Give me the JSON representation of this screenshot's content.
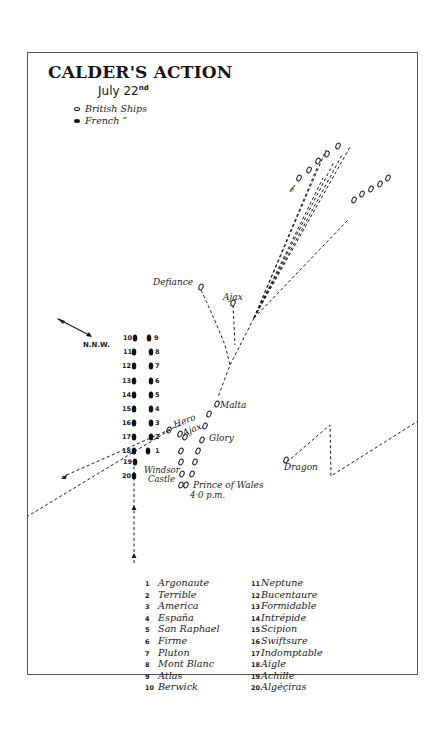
{
  "title": "CALDER'S ACTION",
  "subtitle": {
    "text": "July 22",
    "suffix": "nd"
  },
  "key": [
    {
      "symbol": "open-oval",
      "label": "British  Ships"
    },
    {
      "symbol": "filled-oval",
      "label": "French    ”"
    }
  ],
  "wind": {
    "label": "N.N.W.",
    "icon": "wind-arrow-icon"
  },
  "colors": {
    "ink": "#1a1a1a",
    "frame": "#555555",
    "paper": "#ffffff"
  },
  "british_labels": {
    "defiance": "Defiance",
    "ajax_top": "Ajax",
    "malta": "Malta",
    "hero": "Hero",
    "ajax": "Ajax",
    "glory": "Glory",
    "windsor_castle_1": "Windsor",
    "windsor_castle_2": "Castle",
    "prince_of_wales": "Prince of Wales",
    "time": "4·0 p.m.",
    "dragon": "Dragon"
  },
  "french_column_left": [
    "10",
    "11",
    "12",
    "13",
    "14",
    "15",
    "16",
    "17",
    "18",
    "19",
    "20"
  ],
  "french_column_right": [
    "9",
    "8",
    "7",
    "6",
    "5",
    "4",
    "3",
    "2",
    "1"
  ],
  "legend": {
    "left": [
      {
        "num": "1",
        "name": "Argonaute"
      },
      {
        "num": "2",
        "name": "Terrible"
      },
      {
        "num": "3",
        "name": "America"
      },
      {
        "num": "4",
        "name": "España"
      },
      {
        "num": "5",
        "name": "San Raphael"
      },
      {
        "num": "6",
        "name": "Firme"
      },
      {
        "num": "7",
        "name": "Pluton"
      },
      {
        "num": "8",
        "name": "Mont Blanc"
      },
      {
        "num": "9",
        "name": "Atlas"
      },
      {
        "num": "10",
        "name": "Berwick"
      }
    ],
    "right": [
      {
        "num": "11",
        "name": "Neptune"
      },
      {
        "num": "12",
        "name": "Bucentaure"
      },
      {
        "num": "13",
        "name": "Formidable"
      },
      {
        "num": "14",
        "name": "Intrépide"
      },
      {
        "num": "15",
        "name": "Scipion"
      },
      {
        "num": "16",
        "name": "Swiftsure"
      },
      {
        "num": "17",
        "name": "Indomptable"
      },
      {
        "num": "18",
        "name": "Aigle"
      },
      {
        "num": "19",
        "name": "Achille"
      },
      {
        "num": "20",
        "name": "Algéçiras"
      }
    ]
  }
}
